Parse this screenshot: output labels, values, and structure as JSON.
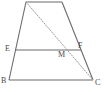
{
  "figure": {
    "type": "geometry-diagram",
    "shape": "trapezoid",
    "width": 104,
    "height": 95,
    "background_color": "#ffffff",
    "stroke_color": "#6b6b6b",
    "dotted_stroke_color": "#9a9a9a",
    "label_color": "#4a4a4a",
    "labels": {
      "E": "E",
      "F": "F",
      "M": "M",
      "B": "B",
      "C": "C"
    },
    "points": {
      "A": {
        "x": 26,
        "y": 2
      },
      "D": {
        "x": 62,
        "y": 2
      },
      "B": {
        "x": 9,
        "y": 80
      },
      "C": {
        "x": 93,
        "y": 80
      },
      "E": {
        "x": 15,
        "y": 50
      },
      "F": {
        "x": 81,
        "y": 50
      },
      "M": {
        "x": 66,
        "y": 51
      }
    },
    "segments": [
      {
        "name": "top-side-AD",
        "from": "A",
        "to": "D",
        "style": "solid"
      },
      {
        "name": "left-side-AB",
        "from": "A",
        "to": "B",
        "style": "solid"
      },
      {
        "name": "right-side-DC",
        "from": "D",
        "to": "C",
        "style": "solid"
      },
      {
        "name": "bottom-side-BC",
        "from": "B",
        "to": "C",
        "style": "solid"
      },
      {
        "name": "midsegment-EF",
        "from": "E",
        "to": "F",
        "style": "solid"
      },
      {
        "name": "diagonal-AC",
        "from": "A",
        "to": "C",
        "style": "dotted"
      },
      {
        "name": "diagonal-DM-to-C",
        "from": "D",
        "to": "C",
        "style": "solid"
      }
    ]
  }
}
